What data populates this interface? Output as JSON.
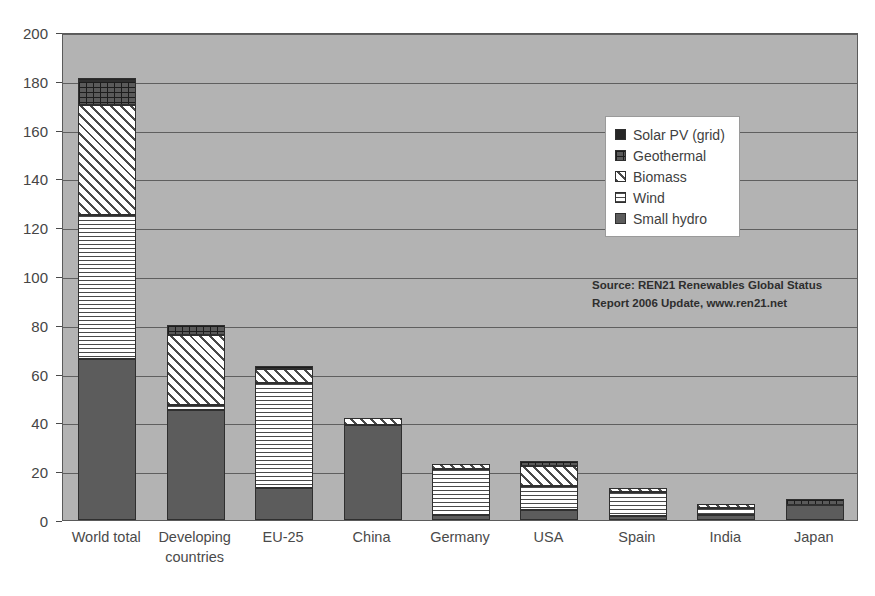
{
  "chart_data": {
    "type": "bar",
    "subtype": "stacked-bar",
    "title": "",
    "xlabel": "",
    "ylabel": "",
    "ylim": [
      0,
      200
    ],
    "ytick_step": 20,
    "yticks": [
      "200",
      "180",
      "160",
      "140",
      "120",
      "100",
      "80",
      "60",
      "40",
      "20",
      "0"
    ],
    "grid": true,
    "legend_position": "inside-top-right",
    "categories": [
      "World total",
      "Developing countries",
      "EU-25",
      "China",
      "Germany",
      "USA",
      "Spain",
      "India",
      "Japan"
    ],
    "category_labels_display": [
      "World total",
      "Developing\ncountries",
      "EU-25",
      "China",
      "Germany",
      "USA",
      "Spain",
      "India",
      "Japan"
    ],
    "series": [
      {
        "name": "Small hydro",
        "pattern": "solid-dark",
        "color": "#5c5c5c",
        "values": [
          66,
          45,
          13,
          39,
          2,
          4,
          1.5,
          2,
          6
        ]
      },
      {
        "name": "Wind",
        "pattern": "horizontal-lines",
        "color": "#ffffff",
        "values": [
          59,
          2,
          43,
          0,
          19,
          10,
          10,
          3,
          0
        ]
      },
      {
        "name": "Biomass",
        "pattern": "diagonal-hatch",
        "color": "#ffffff",
        "values": [
          45,
          29,
          6,
          3,
          2,
          8,
          1.5,
          1.5,
          0
        ]
      },
      {
        "name": "Geothermal",
        "pattern": "brick",
        "color": "#5a5a5a",
        "values": [
          10,
          4,
          1,
          0,
          0,
          2,
          0,
          0,
          2.5
        ]
      },
      {
        "name": "Solar PV (grid)",
        "pattern": "solid-black",
        "color": "#262626",
        "values": [
          1,
          0,
          0,
          0,
          0,
          0,
          0,
          0,
          0
        ]
      }
    ],
    "totals": [
      181,
      80,
      63,
      42,
      23,
      24,
      13,
      6.5,
      8.5
    ]
  },
  "legend": {
    "items": [
      {
        "label": "Solar PV (grid)",
        "swatch": "solid-black-swatch"
      },
      {
        "label": "Geothermal",
        "swatch": "brick-swatch"
      },
      {
        "label": "Biomass",
        "swatch": "diagonal-hatch-swatch"
      },
      {
        "label": "Wind",
        "swatch": "horizontal-lines-swatch"
      },
      {
        "label": "Small hydro",
        "swatch": "solid-dark-swatch"
      }
    ]
  },
  "source_note": {
    "line1": "Source: REN21 Renewables Global Status",
    "line2": "Report 2006 Update, www.ren21.net"
  },
  "colors": {
    "plot_background": "#b3b3b3",
    "gridline": "#5f5f5f",
    "axis_text": "#454545",
    "small_hydro": "#5c5c5c",
    "geothermal": "#5a5a5a",
    "solar_pv": "#262626"
  }
}
